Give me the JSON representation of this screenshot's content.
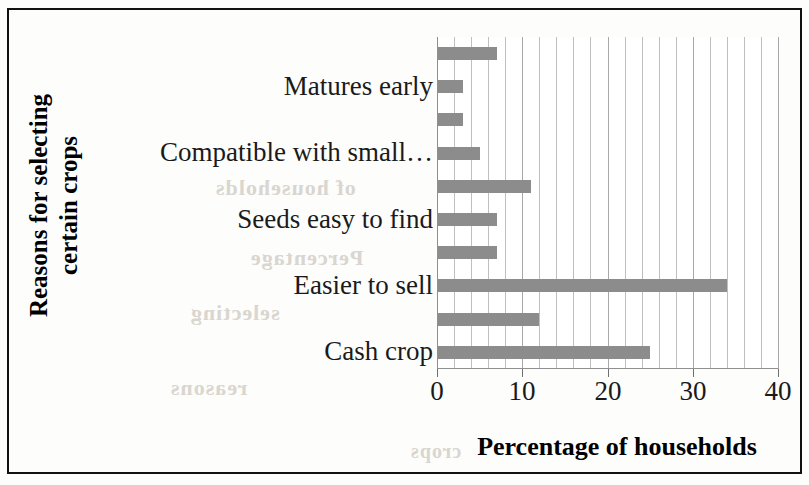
{
  "chart_data": {
    "type": "bar",
    "orientation": "horizontal",
    "title": "",
    "xlabel": "Percentage of households",
    "ylabel": "Reasons for selecting certain crops",
    "ylabel_lines": [
      "Reasons for selecting",
      "certain crops"
    ],
    "xlim": [
      0,
      40
    ],
    "xticks": [
      0,
      10,
      20,
      30,
      40
    ],
    "xtick_labels": [
      "0",
      "10",
      "20",
      "30",
      "40"
    ],
    "minor_tick_step": 2,
    "grid": "vertical-gridlines-every-2-units",
    "legend": "none",
    "bar_color": "#8c8c8c",
    "categories": [
      "",
      "Matures early",
      "",
      "Compatible with small…",
      "",
      "Seeds easy to find",
      "",
      "Easier to sell",
      "",
      "Cash crop"
    ],
    "visible_tick_labels": [
      "Matures early",
      "Compatible with small…",
      "Seeds easy to find",
      "Easier to sell",
      "Cash crop"
    ],
    "values": [
      7,
      3,
      3,
      5,
      11,
      7,
      7,
      34,
      12,
      25
    ],
    "bars": [
      {
        "label": "",
        "value": 7
      },
      {
        "label": "Matures early",
        "value": 3
      },
      {
        "label": "",
        "value": 3
      },
      {
        "label": "Compatible with small…",
        "value": 5
      },
      {
        "label": "",
        "value": 11
      },
      {
        "label": "Seeds easy to find",
        "value": 7
      },
      {
        "label": "",
        "value": 7
      },
      {
        "label": "Easier to sell",
        "value": 34
      },
      {
        "label": "",
        "value": 12
      },
      {
        "label": "Cash crop",
        "value": 25
      }
    ]
  },
  "bleed_through": [
    "of households",
    "Percentage",
    "selecting",
    "reasons",
    "crops"
  ]
}
